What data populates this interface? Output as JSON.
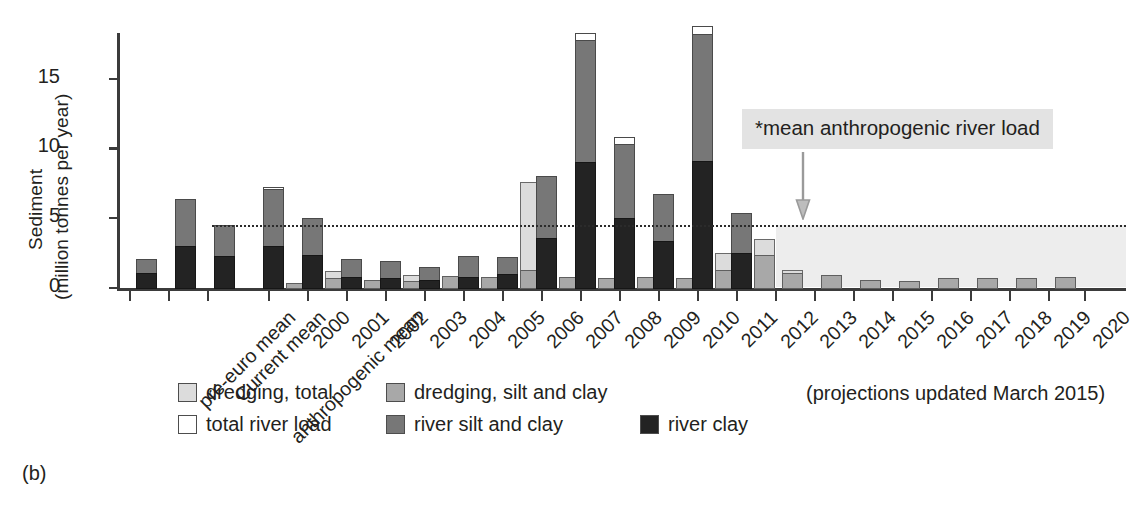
{
  "panel_label": "(b)",
  "axis": {
    "y_title_line1": "Sediment",
    "y_title_line2": "(million tonnes per year)",
    "y_ticks": [
      "0",
      "5",
      "10",
      "15"
    ],
    "y_tick_values": [
      0,
      5,
      10,
      15
    ],
    "ylim": [
      0,
      19.2
    ]
  },
  "annotation": {
    "text": "*mean anthropogenic river load",
    "value": 4.5
  },
  "projection_note": "(projections updated March 2015)",
  "legend": {
    "items": [
      {
        "label": "dredging, total",
        "color": "#dcdcdc",
        "key": "dredging_total"
      },
      {
        "label": "dredging, silt and clay",
        "color": "#a8a8a8",
        "key": "dredging_silt_clay"
      },
      {
        "label": "total river load",
        "color": "#ffffff",
        "key": "river_total"
      },
      {
        "label": "river silt and clay",
        "color": "#777777",
        "key": "river_silt_clay"
      },
      {
        "label": "river clay",
        "color": "#232323",
        "key": "river_clay"
      }
    ]
  },
  "chart_data": {
    "type": "bar",
    "title": "",
    "xlabel": "",
    "ylabel": "Sediment (million tonnes per year)",
    "ylim": [
      0,
      19.2
    ],
    "grid": false,
    "legend_position": "bottom",
    "mean_anthropogenic_river_load": 4.5,
    "projection_start_category": "2013",
    "categories": [
      "pre-euro mean",
      "Current mean",
      "anthropogenic mean",
      "2000",
      "2001",
      "2002",
      "2003",
      "2004",
      "2005",
      "2006",
      "2007",
      "2008",
      "2009",
      "2010",
      "2011",
      "2012",
      "2013",
      "2014",
      "2015",
      "2016",
      "2017",
      "2018",
      "2019",
      "2020"
    ],
    "series": [
      {
        "name": "river total",
        "key": "river_total",
        "values": [
          2.1,
          6.4,
          4.5,
          7.25,
          5.0,
          2.1,
          1.9,
          1.5,
          2.3,
          2.2,
          8.0,
          18.3,
          10.8,
          6.75,
          18.8,
          5.4,
          null,
          null,
          null,
          null,
          null,
          null,
          null,
          null
        ]
      },
      {
        "name": "river silt and clay",
        "key": "river_silt_clay",
        "values": [
          2.1,
          6.4,
          4.5,
          7.1,
          5.0,
          2.1,
          1.9,
          1.5,
          2.3,
          2.2,
          8.0,
          17.8,
          10.3,
          6.75,
          18.2,
          5.4,
          null,
          null,
          null,
          null,
          null,
          null,
          null,
          null
        ]
      },
      {
        "name": "river clay",
        "key": "river_clay",
        "values": [
          1.1,
          3.0,
          2.3,
          3.0,
          2.35,
          0.8,
          0.75,
          0.6,
          0.8,
          1.0,
          3.6,
          9.0,
          5.0,
          3.4,
          9.1,
          2.5,
          null,
          null,
          null,
          null,
          null,
          null,
          null,
          null
        ]
      },
      {
        "name": "dredging total",
        "key": "dredging_total",
        "values": [
          null,
          null,
          null,
          0.35,
          1.25,
          0.6,
          0.95,
          0.85,
          0.8,
          7.6,
          0.8,
          0.75,
          0.8,
          0.75,
          2.5,
          3.5,
          1.3,
          0.95,
          0.55,
          0.5,
          0.7,
          0.75,
          0.75,
          0.8
        ]
      },
      {
        "name": "dredging silt and clay",
        "key": "dredging_silt_clay",
        "values": [
          null,
          null,
          null,
          0.35,
          0.75,
          0.6,
          0.5,
          0.85,
          0.8,
          1.3,
          0.8,
          0.75,
          0.8,
          0.75,
          1.3,
          2.4,
          1.05,
          0.95,
          0.55,
          0.5,
          0.7,
          0.75,
          0.75,
          0.8
        ]
      }
    ]
  }
}
